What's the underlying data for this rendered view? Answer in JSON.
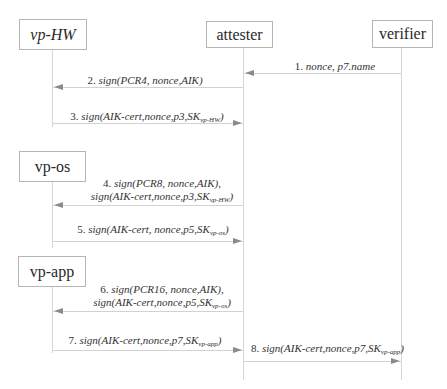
{
  "diagram": {
    "type": "sequence",
    "colors": {
      "box_border": "#b5b5b5",
      "lifeline": "#d6d6d6",
      "message_line": "#d2d2d2",
      "arrowhead": "#8a8a8a",
      "text": "#333333"
    },
    "actors": [
      {
        "id": "vp-hw",
        "label": "vp-HW",
        "italic": true
      },
      {
        "id": "attester",
        "label": "attester",
        "italic": false
      },
      {
        "id": "verifier",
        "label": "verifier",
        "italic": false
      },
      {
        "id": "vp-os",
        "label": "vp-os",
        "italic": false
      },
      {
        "id": "vp-app",
        "label": "vp-app",
        "italic": false
      }
    ],
    "messages": [
      {
        "num": "1.",
        "line1": "nonce, p7.name",
        "from": "verifier",
        "to": "attester"
      },
      {
        "num": "2.",
        "line1": "sign(PCR4, nonce,AIK)",
        "from": "attester",
        "to": "vp-HW"
      },
      {
        "num": "3.",
        "line1_pre": "sign(AIK-cert,nonce,p3,SK",
        "line1_sub": "vp-HW",
        "line1_post": ")",
        "from": "vp-HW",
        "to": "attester"
      },
      {
        "num": "4.",
        "line1": "sign(PCR8, nonce,AIK),",
        "line2_pre": "sign(AIK-cert,nonce,p3,SK",
        "line2_sub": "vp-HW",
        "line2_post": ")",
        "from": "attester",
        "to": "vp-os"
      },
      {
        "num": "5.",
        "line1_pre": "sign(AIK-cert, nonce,p5,SK",
        "line1_sub": "vp-os",
        "line1_post": ")",
        "from": "vp-os",
        "to": "attester"
      },
      {
        "num": "6.",
        "line1": "sign(PCR16, nonce,AIK),",
        "line2_pre": "sign(AIK-cert,nonce,p5,SK",
        "line2_sub": "vp-os",
        "line2_post": ")",
        "from": "attester",
        "to": "vp-app"
      },
      {
        "num": "7.",
        "line1_pre": "sign(AIK-cert,nonce,p7,SK",
        "line1_sub": "vp-app",
        "line1_post": ")",
        "from": "vp-app",
        "to": "attester"
      },
      {
        "num": "8.",
        "line1_pre": "sign(AIK-cert,nonce,p7,SK",
        "line1_sub": "vp-app",
        "line1_post": ")",
        "from": "attester",
        "to": "verifier"
      }
    ]
  }
}
